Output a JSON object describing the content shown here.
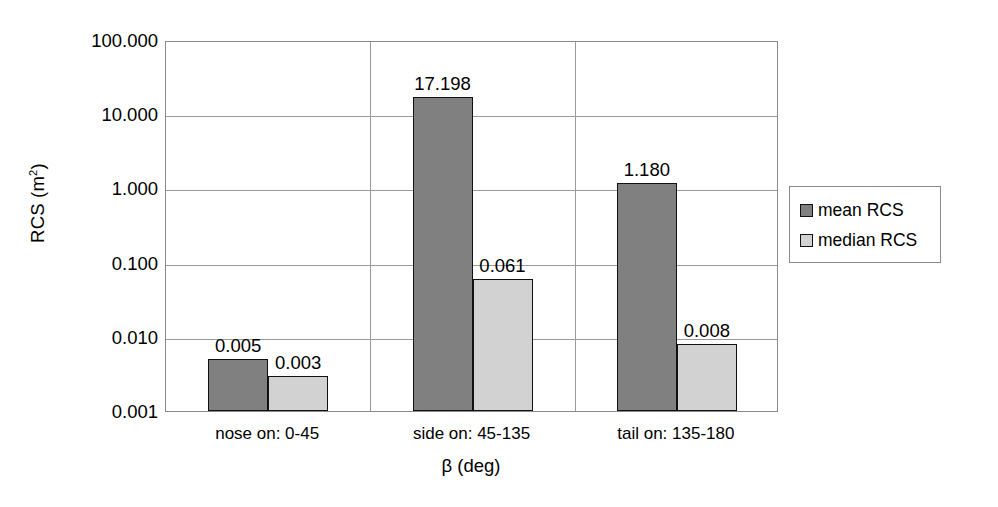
{
  "chart_data": {
    "type": "bar",
    "title": "",
    "xlabel": "β (deg)",
    "ylabel": "RCS (m²)",
    "ylabel_base": "RCS (m",
    "ylabel_sup": "2",
    "ylabel_tail": ")",
    "yscale": "log",
    "ylim": [
      0.001,
      100
    ],
    "grid": true,
    "legend_position": "right",
    "categories": [
      "nose on:  0-45",
      "side on: 45-135",
      "tail on: 135-180"
    ],
    "y_ticks": [
      "100.000",
      "10.000",
      "1.000",
      "0.100",
      "0.010",
      "0.001"
    ],
    "y_tick_values": [
      100,
      10,
      1,
      0.1,
      0.01,
      0.001
    ],
    "series": [
      {
        "name": "mean RCS",
        "color": "#808080",
        "values": [
          0.005,
          17.198,
          1.18
        ],
        "labels": [
          "0.005",
          "17.198",
          "1.180"
        ]
      },
      {
        "name": "median RCS",
        "color": "#d2d2d2",
        "values": [
          0.003,
          0.061,
          0.008
        ],
        "labels": [
          "0.003",
          "0.061",
          "0.008"
        ]
      }
    ]
  },
  "legend": {
    "items": [
      {
        "label": "mean RCS",
        "swatch": "mean"
      },
      {
        "label": "median RCS",
        "swatch": "median"
      }
    ]
  }
}
